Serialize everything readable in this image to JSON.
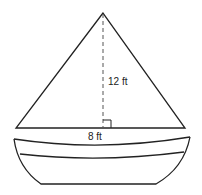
{
  "diagram": {
    "labels": {
      "height": "12 ft",
      "base": "8 ft"
    },
    "colors": {
      "stroke": "#222222",
      "dash": "#555555",
      "background": "#ffffff"
    }
  }
}
